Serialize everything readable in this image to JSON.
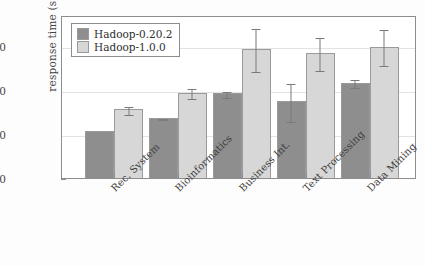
{
  "chart_data": {
    "type": "bar",
    "title": "",
    "xlabel": "",
    "ylabel": "response time (s)",
    "categories": [
      "Rec. System",
      "Bioinformatics",
      "Business Int.",
      "Text Processing",
      "Data Mining"
    ],
    "series": [
      {
        "name": "Hadoop-0.20.2",
        "color": "#8e8e8e",
        "values": [
          53,
          68,
          96,
          87,
          108
        ],
        "errors": [
          0,
          1,
          4,
          22,
          5
        ]
      },
      {
        "name": "Hadoop-1.0.0",
        "color": "#d7d7d7",
        "values": [
          78,
          97,
          146,
          142,
          149
        ],
        "errors": [
          5,
          6,
          25,
          19,
          21
        ]
      }
    ],
    "ylim": [
      0,
      185
    ],
    "yticks": [
      0,
      50,
      100,
      150
    ],
    "ytick_labels": [
      "0",
      "50",
      "100",
      "150"
    ],
    "grid": true,
    "grid_axis": "y",
    "legend_position": "upper left",
    "error_bars": "symmetric"
  },
  "legend": {
    "entries": [
      {
        "label": "Hadoop-0.20.2"
      },
      {
        "label": "Hadoop-1.0.0"
      }
    ]
  }
}
